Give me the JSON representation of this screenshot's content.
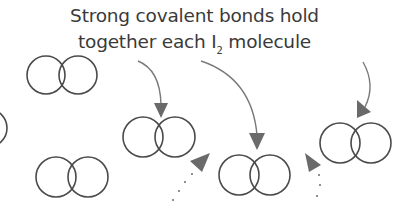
{
  "caption": {
    "line1": "Strong covalent bonds hold",
    "line2_before": "together each I",
    "line2_sub": "2",
    "line2_after": " molecule"
  },
  "colors": {
    "circle_stroke": "#4a4a4a",
    "arrow": "#6e6e6e",
    "text": "#3a3a3a",
    "background": "#ffffff"
  },
  "molecules": [
    {
      "id": "A",
      "left": {
        "cx": 46,
        "cy": 75
      },
      "right": {
        "cx": 78,
        "cy": 75
      },
      "r": 19
    },
    {
      "id": "partial-left-edge",
      "left": {
        "cx": -12,
        "cy": 128
      },
      "r": 19
    },
    {
      "id": "B",
      "left": {
        "cx": 56,
        "cy": 177
      },
      "right": {
        "cx": 88,
        "cy": 177
      },
      "r": 20
    },
    {
      "id": "C",
      "left": {
        "cx": 143,
        "cy": 137
      },
      "right": {
        "cx": 175,
        "cy": 137
      },
      "r": 20
    },
    {
      "id": "D",
      "left": {
        "cx": 239,
        "cy": 175
      },
      "right": {
        "cx": 270,
        "cy": 175
      },
      "r": 20
    },
    {
      "id": "E",
      "left": {
        "cx": 340,
        "cy": 143
      },
      "right": {
        "cx": 371,
        "cy": 143
      },
      "r": 20
    }
  ],
  "arrows": [
    {
      "id": "to-C",
      "style": "solid-curve"
    },
    {
      "id": "to-D",
      "style": "solid-curve"
    },
    {
      "id": "to-E",
      "style": "solid-curve"
    },
    {
      "id": "dotted-C-D",
      "style": "dotted"
    },
    {
      "id": "dotted-D-E",
      "style": "dotted"
    }
  ]
}
